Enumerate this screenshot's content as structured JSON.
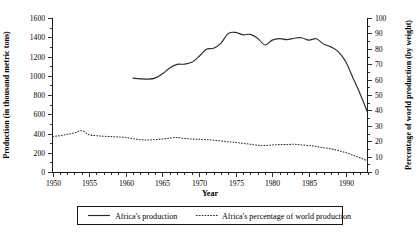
{
  "chart_data": {
    "type": "line",
    "title": "",
    "xlabel": "Year",
    "ylabel": "Production (in thousand metric tons)",
    "y2label": "Percentage of world production (by weight)",
    "xlim": [
      1950,
      1993
    ],
    "ylim": [
      0,
      1600
    ],
    "y2lim": [
      0,
      100
    ],
    "grid": false,
    "legend_position": "bottom-center",
    "x_ticks": [
      1950,
      1955,
      1960,
      1965,
      1970,
      1975,
      1980,
      1985,
      1990
    ],
    "x_tick_labels": [
      "1950",
      "1955",
      "1960",
      "1965",
      "1970",
      "1975",
      "1980",
      "1985",
      "1990"
    ],
    "x_minor_step": 1,
    "y_ticks": [
      0,
      200,
      400,
      600,
      800,
      1000,
      1200,
      1400,
      1600
    ],
    "y_tick_labels": [
      "0",
      "200",
      "400",
      "600",
      "800",
      "1000",
      "1200",
      "1400",
      "1600"
    ],
    "y2_ticks": [
      0,
      10,
      20,
      30,
      40,
      50,
      60,
      70,
      80,
      90,
      100
    ],
    "y2_tick_labels": [
      "0",
      "10",
      "20",
      "30",
      "40",
      "50",
      "60",
      "70",
      "80",
      "90",
      "100"
    ],
    "series": [
      {
        "name": "Africa's production",
        "style": "solid",
        "axis": "left",
        "units": "thousand metric tons",
        "x": [
          1961,
          1962,
          1963,
          1964,
          1965,
          1966,
          1967,
          1968,
          1969,
          1970,
          1971,
          1972,
          1973,
          1974,
          1975,
          1976,
          1977,
          1978,
          1979,
          1980,
          1981,
          1982,
          1983,
          1984,
          1985,
          1986,
          1987,
          1988,
          1989,
          1990,
          1991,
          1992,
          1993
        ],
        "values": [
          975,
          968,
          965,
          975,
          1020,
          1080,
          1118,
          1120,
          1140,
          1200,
          1275,
          1285,
          1340,
          1440,
          1450,
          1425,
          1430,
          1390,
          1320,
          1370,
          1385,
          1375,
          1390,
          1395,
          1370,
          1385,
          1330,
          1300,
          1250,
          1150,
          980,
          810,
          620
        ]
      },
      {
        "name": "Africa's percentage of world production",
        "style": "dotted",
        "axis": "right",
        "units": "percent by weight",
        "x": [
          1950,
          1951,
          1952,
          1953,
          1954,
          1955,
          1956,
          1957,
          1958,
          1959,
          1960,
          1961,
          1962,
          1963,
          1964,
          1965,
          1966,
          1967,
          1968,
          1969,
          1970,
          1971,
          1972,
          1973,
          1974,
          1975,
          1976,
          1977,
          1978,
          1979,
          1980,
          1981,
          1982,
          1983,
          1984,
          1985,
          1986,
          1987,
          1988,
          1989,
          1990,
          1991,
          1992,
          1993
        ],
        "values": [
          23.0,
          23.6,
          24.4,
          25.4,
          26.8,
          24.2,
          23.6,
          23.2,
          23.0,
          22.8,
          22.4,
          21.6,
          21.0,
          20.8,
          21.0,
          21.4,
          22.0,
          22.4,
          21.8,
          21.4,
          21.2,
          21.0,
          20.6,
          20.2,
          19.6,
          19.2,
          18.6,
          18.0,
          17.4,
          17.2,
          17.6,
          17.8,
          17.8,
          18.0,
          17.6,
          17.2,
          16.6,
          15.8,
          15.0,
          14.0,
          12.6,
          11.0,
          9.2,
          7.2
        ]
      }
    ]
  },
  "legend": {
    "items": [
      {
        "label": "Africa's production",
        "style": "solid"
      },
      {
        "label": "Africa's percentage of world production",
        "style": "dotted"
      }
    ]
  }
}
